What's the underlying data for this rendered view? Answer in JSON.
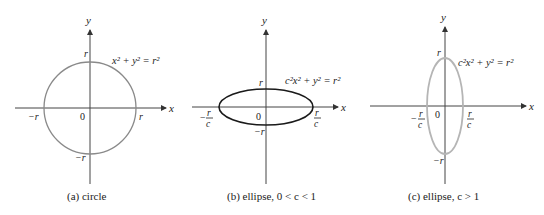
{
  "figure": {
    "panels": [
      {
        "id": "a",
        "caption": "(a) circle",
        "equation": "x² + y² = r²",
        "curve": "circle",
        "stroke_color": "#8a8a8a",
        "labels": {
          "y_axis": "y",
          "x_axis": "x",
          "top": "r",
          "bottom": "−r",
          "left": "−r",
          "right": "r",
          "origin": "0"
        }
      },
      {
        "id": "b",
        "caption": "(b) ellipse, 0 < c < 1",
        "equation": "c²x² + y² = r²",
        "curve": "ellipse-wide",
        "stroke_color": "#1a1a1a",
        "labels": {
          "y_axis": "y",
          "x_axis": "x",
          "top": "r",
          "bottom": "−r",
          "left_num": "r",
          "left_den": "c",
          "left_sign": "−",
          "right_num": "r",
          "right_den": "c",
          "origin": "0"
        }
      },
      {
        "id": "c",
        "caption": "(c) ellipse,  c > 1",
        "equation": "c²x² + y² = r²",
        "curve": "ellipse-tall",
        "stroke_color": "#b5b5b5",
        "labels": {
          "y_axis": "y",
          "x_axis": "x",
          "top": "r",
          "bottom": "−r",
          "left_num": "r",
          "left_den": "c",
          "left_sign": "−",
          "right_num": "r",
          "right_den": "c",
          "origin": "0"
        }
      }
    ]
  }
}
